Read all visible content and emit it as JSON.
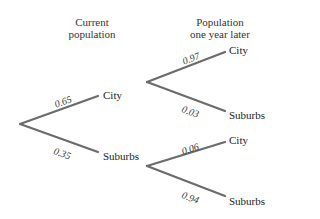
{
  "headers": {
    "current": [
      "Current",
      "population"
    ],
    "later": [
      "Population",
      "one year later"
    ]
  },
  "tree": {
    "level1": [
      {
        "label": "City",
        "prob": "0.65"
      },
      {
        "label": "Suburbs",
        "prob": "0.35"
      }
    ],
    "level2": [
      {
        "label": "City",
        "prob": "0.97"
      },
      {
        "label": "Suburbs",
        "prob": "0.03"
      },
      {
        "label": "City",
        "prob": "0.06"
      },
      {
        "label": "Suburbs",
        "prob": "0.94"
      }
    ]
  },
  "colors": {
    "line": "#6b6b6b"
  }
}
